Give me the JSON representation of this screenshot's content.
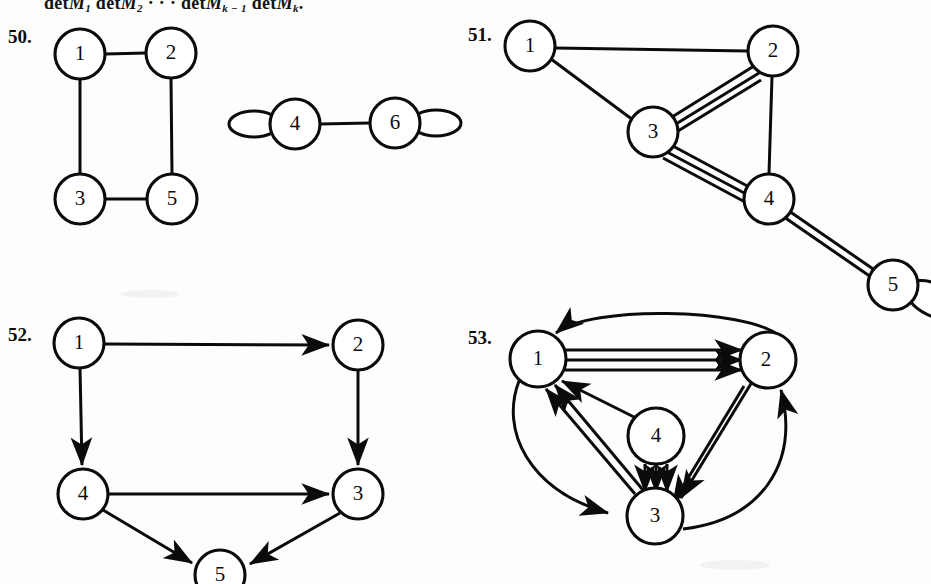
{
  "page": {
    "background_color": "#fdfdfc",
    "ink_color": "#0b0b0b",
    "top_formula_parts": {
      "p1": "det",
      "m1": "M",
      "s1": "1",
      "p2": "det",
      "m2": "M",
      "s2": "2",
      "dots": "· · ·",
      "p3": "det",
      "m3": "M",
      "s3": "k − 1",
      "p4": "det",
      "m4": "M",
      "s4": "k",
      "period": "."
    },
    "top_formula_text": "detM1 detM2 ··· detMk−1 detMk."
  },
  "exercises": [
    {
      "number": "50.",
      "caption": "undirected multigraph with two components",
      "graph_type": "undirected-multigraph",
      "nodes": [
        {
          "id": "1",
          "label": "1",
          "cx": 80,
          "cy": 54,
          "r": 25
        },
        {
          "id": "2",
          "label": "2",
          "cx": 171,
          "cy": 53,
          "r": 25
        },
        {
          "id": "3",
          "label": "3",
          "cx": 80,
          "cy": 199,
          "r": 25
        },
        {
          "id": "5",
          "label": "5",
          "cx": 172,
          "cy": 199,
          "r": 25
        },
        {
          "id": "4",
          "label": "4",
          "cx": 295,
          "cy": 124,
          "r": 25
        },
        {
          "id": "6",
          "label": "6",
          "cx": 395,
          "cy": 123,
          "r": 25
        }
      ],
      "edges": [
        {
          "from": "1",
          "to": "2",
          "multiplicity": 1
        },
        {
          "from": "1",
          "to": "3",
          "multiplicity": 1
        },
        {
          "from": "2",
          "to": "5",
          "multiplicity": 1
        },
        {
          "from": "3",
          "to": "5",
          "multiplicity": 1
        },
        {
          "from": "4",
          "to": "6",
          "multiplicity": 1
        }
      ],
      "loops": [
        {
          "at": "4",
          "side": "left"
        },
        {
          "at": "6",
          "side": "right"
        }
      ]
    },
    {
      "number": "51.",
      "caption": "undirected multigraph with multiple edges and a loop",
      "graph_type": "undirected-multigraph",
      "nodes": [
        {
          "id": "1",
          "label": "1",
          "cx": 530,
          "cy": 46,
          "r": 25
        },
        {
          "id": "2",
          "label": "2",
          "cx": 773,
          "cy": 51,
          "r": 25
        },
        {
          "id": "3",
          "label": "3",
          "cx": 653,
          "cy": 132,
          "r": 25
        },
        {
          "id": "4",
          "label": "4",
          "cx": 769,
          "cy": 199,
          "r": 25
        },
        {
          "id": "5",
          "label": "5",
          "cx": 893,
          "cy": 285,
          "r": 25
        }
      ],
      "edges": [
        {
          "from": "1",
          "to": "2",
          "multiplicity": 1
        },
        {
          "from": "1",
          "to": "3",
          "multiplicity": 1
        },
        {
          "from": "2",
          "to": "3",
          "multiplicity": 3
        },
        {
          "from": "2",
          "to": "4",
          "multiplicity": 1
        },
        {
          "from": "3",
          "to": "4",
          "multiplicity": 3
        },
        {
          "from": "4",
          "to": "5",
          "multiplicity": 2
        }
      ],
      "loops": [
        {
          "at": "5",
          "side": "right"
        }
      ]
    },
    {
      "number": "52.",
      "caption": "directed graph",
      "graph_type": "directed-graph",
      "nodes": [
        {
          "id": "1",
          "label": "1",
          "cx": 79,
          "cy": 343,
          "r": 25
        },
        {
          "id": "2",
          "label": "2",
          "cx": 358,
          "cy": 345,
          "r": 25
        },
        {
          "id": "4",
          "label": "4",
          "cx": 83,
          "cy": 494,
          "r": 25
        },
        {
          "id": "3",
          "label": "3",
          "cx": 358,
          "cy": 494,
          "r": 25
        },
        {
          "id": "5",
          "label": "5",
          "cx": 220,
          "cy": 574,
          "r": 25
        }
      ],
      "edges": [
        {
          "from": "1",
          "to": "2",
          "multiplicity": 1
        },
        {
          "from": "1",
          "to": "4",
          "multiplicity": 1
        },
        {
          "from": "2",
          "to": "3",
          "multiplicity": 1
        },
        {
          "from": "4",
          "to": "3",
          "multiplicity": 1
        },
        {
          "from": "4",
          "to": "5",
          "multiplicity": 1
        },
        {
          "from": "3",
          "to": "5",
          "multiplicity": 1
        }
      ],
      "loops": []
    },
    {
      "number": "53.",
      "caption": "directed multigraph with multiple arcs",
      "graph_type": "directed-multigraph",
      "nodes": [
        {
          "id": "1",
          "label": "1",
          "cx": 538,
          "cy": 359,
          "r": 28
        },
        {
          "id": "2",
          "label": "2",
          "cx": 768,
          "cy": 360,
          "r": 28
        },
        {
          "id": "4",
          "label": "4",
          "cx": 656,
          "cy": 436,
          "r": 28
        },
        {
          "id": "3",
          "label": "3",
          "cx": 655,
          "cy": 516,
          "r": 28
        }
      ],
      "edges": [
        {
          "from": "1",
          "to": "2",
          "multiplicity": 3,
          "style": "straight"
        },
        {
          "from": "2",
          "to": "1",
          "multiplicity": 1,
          "style": "curve-above"
        },
        {
          "from": "1",
          "to": "3",
          "multiplicity": 1,
          "style": "curve-left"
        },
        {
          "from": "3",
          "to": "1",
          "multiplicity": 2,
          "style": "straight"
        },
        {
          "from": "2",
          "to": "3",
          "multiplicity": 2,
          "style": "straight"
        },
        {
          "from": "3",
          "to": "2",
          "multiplicity": 1,
          "style": "curve-right"
        },
        {
          "from": "4",
          "to": "1",
          "multiplicity": 1,
          "style": "straight"
        },
        {
          "from": "4",
          "to": "3",
          "multiplicity": 3,
          "style": "straight"
        }
      ],
      "loops": []
    }
  ]
}
